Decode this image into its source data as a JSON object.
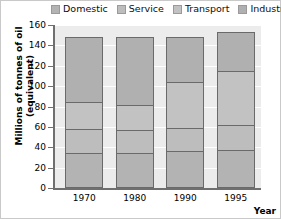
{
  "chart_data": {
    "type": "bar",
    "subtype": "stacked-bar",
    "title": "",
    "xlabel": "Year",
    "ylabel": "Millions of tonnes of oil (equivalent)",
    "categories": [
      "1970",
      "1980",
      "1990",
      "1995"
    ],
    "ylim": [
      0,
      160
    ],
    "yticks": [
      0,
      20,
      40,
      60,
      80,
      100,
      120,
      140,
      160
    ],
    "yticklabels": [
      "0",
      "20",
      "40",
      "60",
      "80",
      "100",
      "120",
      "140",
      "160"
    ],
    "grid": true,
    "legend_position": "top",
    "series": [
      {
        "name": "Domestic",
        "color": "#b3b3b3",
        "values": [
          33,
          33,
          35,
          36
        ]
      },
      {
        "name": "Service",
        "color": "#bdbdbd",
        "values": [
          24,
          23,
          23,
          25
        ]
      },
      {
        "name": "Transport",
        "color": "#c2c2c2",
        "values": [
          26,
          25,
          45,
          53
        ]
      },
      {
        "name": "Industry",
        "color": "#b0b0b0",
        "values": [
          64,
          66,
          44,
          38
        ]
      }
    ],
    "totals": [
      147,
      147,
      147,
      152
    ],
    "cumulative_boundaries": {
      "1970": [
        33,
        57,
        83,
        147
      ],
      "1980": [
        33,
        56,
        81,
        147
      ],
      "1990": [
        35,
        58,
        103,
        147
      ],
      "1995": [
        36,
        61,
        114,
        152
      ]
    }
  },
  "legend": {
    "items": [
      {
        "label": "Domestic",
        "swatch_color": "#b3b3b3"
      },
      {
        "label": "Service",
        "swatch_color": "#bdbdbd"
      },
      {
        "label": "Transport",
        "swatch_color": "#c2c2c2"
      },
      {
        "label": "Industry",
        "swatch_color": "#b0b0b0"
      }
    ]
  },
  "axes": {
    "y_title": "Millions of tonnes of oil (equivalent)",
    "x_title": "Year"
  }
}
